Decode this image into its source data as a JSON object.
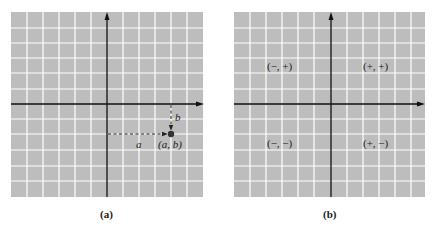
{
  "colors": {
    "grid_fill": "#bdbdbd",
    "grid_line": "#ffffff",
    "axis": "#111111",
    "point": "#333333"
  },
  "panel_a": {
    "caption": "(a)",
    "point_label": "(a, b)",
    "horizontal_label": "a",
    "vertical_label": "b"
  },
  "panel_b": {
    "caption": "(b)",
    "quadrants": {
      "q1": "(+, +)",
      "q2": "(−, +)",
      "q3": "(−, −)",
      "q4": "(+, −)"
    }
  }
}
